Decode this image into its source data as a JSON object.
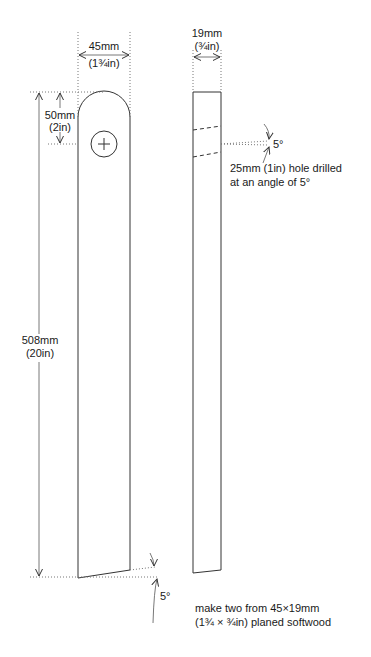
{
  "drawing": {
    "width_dim": {
      "metric": "45mm",
      "imperial": "(1¾in)"
    },
    "top_dim": {
      "metric": "50mm",
      "imperial": "(2in)"
    },
    "length_dim": {
      "metric": "508mm",
      "imperial": "(20in)"
    },
    "thickness_dim": {
      "metric": "19mm",
      "imperial": "(¾in)"
    },
    "hole_angle": "5°",
    "bottom_angle": "5°",
    "hole_note": [
      "25mm (1in) hole drilled",
      "at an angle of 5°"
    ],
    "material_note": [
      "make two from 45×19mm",
      "(1¾ × ¾in) planed softwood"
    ]
  }
}
